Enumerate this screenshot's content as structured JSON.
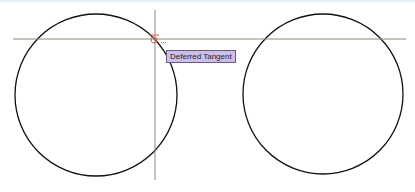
{
  "viewport": {
    "background": "#ffffff"
  },
  "drawing": {
    "circles": [
      {
        "id": "left-circle",
        "cx": 96,
        "cy": 95,
        "r": 81,
        "stroke": "#111111"
      },
      {
        "id": "right-circle",
        "cx": 323,
        "cy": 94,
        "r": 80,
        "stroke": "#111111"
      }
    ],
    "crosshair": {
      "horizontal": {
        "y": 39,
        "x1": 13,
        "x2": 406
      },
      "vertical": {
        "x": 155,
        "y1": 10,
        "y2": 180
      },
      "color": "#8a8a7a"
    },
    "snap_marker": {
      "type": "deferred-tangent",
      "x": 154,
      "y": 37,
      "color": "#e06050"
    }
  },
  "tooltip": {
    "text": "Deferred Tangent",
    "background": "#cbbfe3",
    "border": "#6a5a8a"
  }
}
